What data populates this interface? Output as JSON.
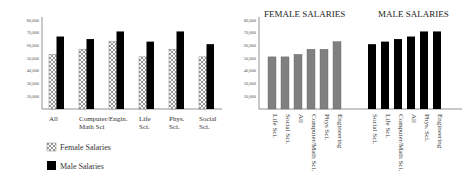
{
  "chart_data": [
    {
      "type": "bar",
      "title": "",
      "xlabel": "",
      "ylabel": "",
      "ylim": [
        10000,
        80000
      ],
      "yticks": [
        "20,000",
        "30,000",
        "40,000",
        "50,000",
        "60,000",
        "70,000",
        "80,000"
      ],
      "ytick_values": [
        20000,
        30000,
        40000,
        50000,
        60000,
        70000,
        80000
      ],
      "categories": [
        "All",
        "Computer/\nMath Sci",
        "Engin.",
        "Life\nSci.",
        "Phys.\nSci.",
        "Social\nSci."
      ],
      "series": [
        {
          "name": "Female Salaries",
          "pattern": "crosshatch",
          "values": [
            53000,
            57000,
            63000,
            51000,
            57000,
            51000
          ]
        },
        {
          "name": "Male Salaries",
          "color": "#000000",
          "values": [
            67000,
            65000,
            71000,
            63000,
            71000,
            61000
          ]
        }
      ],
      "legend": {
        "placement": "bottom-left",
        "entries": [
          "Female Salaries",
          "Male Salaries"
        ]
      },
      "grid": false
    },
    {
      "type": "bar",
      "ylim": [
        10000,
        80000
      ],
      "yticks": [
        "20,000",
        "30,000",
        "40,000",
        "50,000",
        "60,000",
        "70,000",
        "80,000"
      ],
      "ytick_values": [
        20000,
        30000,
        40000,
        50000,
        60000,
        70000,
        80000
      ],
      "panels": [
        {
          "title": "FEMALE SALARIES",
          "color": "#808080",
          "categories": [
            "Life Sci.",
            "Social Sci.",
            "All",
            "Computer/Math Sci.",
            "Phys Sci.",
            "Engineering"
          ],
          "values": [
            51000,
            51000,
            53000,
            57000,
            57000,
            63000
          ]
        },
        {
          "title": "MALE SALARIES",
          "color": "#000000",
          "categories": [
            "Social Sci.",
            "Life Sci.",
            "Computer/Math Sci.",
            "All",
            "Phys. Sci.",
            "Engineering"
          ],
          "values": [
            61000,
            63000,
            65000,
            67000,
            71000,
            71000
          ]
        }
      ],
      "grid": false
    }
  ]
}
